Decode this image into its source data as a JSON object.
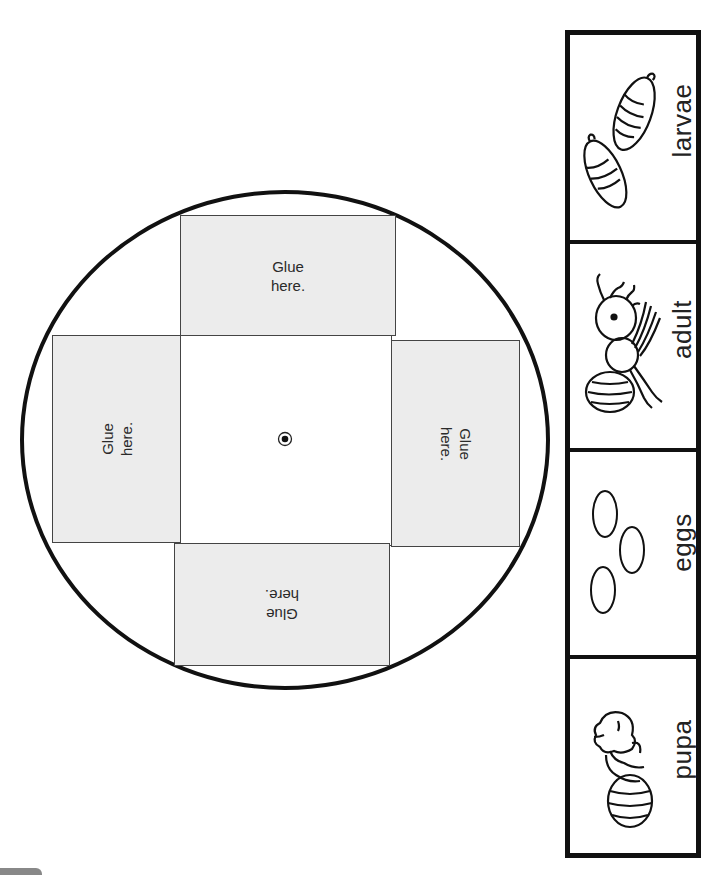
{
  "worksheet": {
    "wheel": {
      "glue_panels": [
        {
          "position": "top",
          "line1": "Glue",
          "line2": "here.",
          "rotation_deg": 0
        },
        {
          "position": "left",
          "line1": "Glue",
          "line2": "here.",
          "rotation_deg": -90
        },
        {
          "position": "right",
          "line1": "Glue",
          "line2": "here.",
          "rotation_deg": 90
        },
        {
          "position": "bottom",
          "line1": "Glue",
          "line2": "here.",
          "rotation_deg": 180
        }
      ],
      "center_marker": "brad-hole"
    },
    "life_cycle_cards": [
      {
        "label": "larvae",
        "icon": "larvae-icon"
      },
      {
        "label": "adult",
        "icon": "adult-ant-icon"
      },
      {
        "label": "eggs",
        "icon": "eggs-icon"
      },
      {
        "label": "pupa",
        "icon": "pupa-icon"
      }
    ],
    "colors": {
      "panel_fill": "#ececec",
      "outline": "#111111"
    }
  }
}
